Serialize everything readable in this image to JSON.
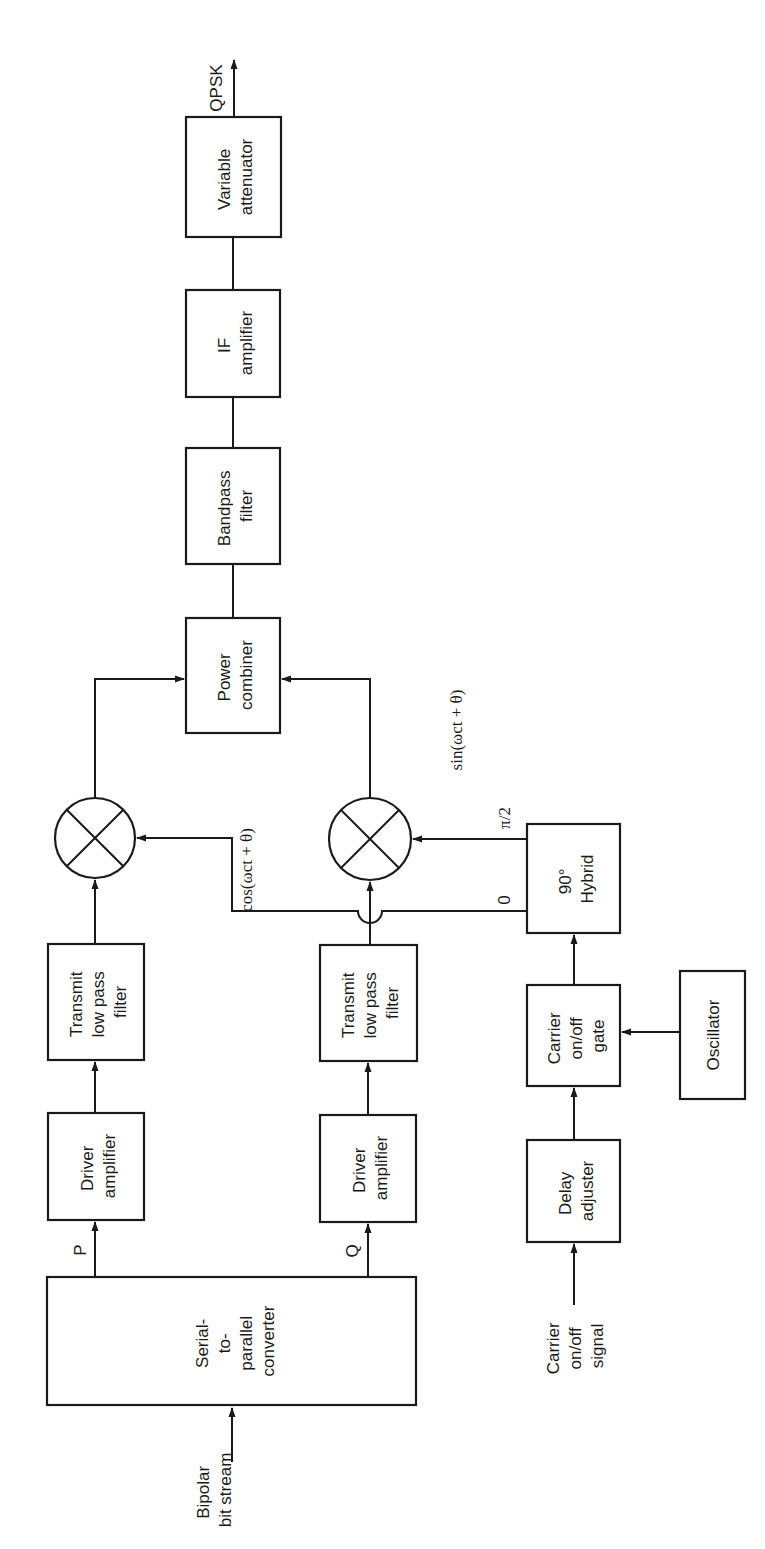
{
  "figure": {
    "orientation": "rotated-90-ccw",
    "line_color": "#1a1a1a",
    "background": "#ffffff"
  },
  "blocks": {
    "serial_to_parallel": {
      "lines": [
        "Serial-",
        "to-",
        "parallel",
        "converter"
      ]
    },
    "driver_amp_p": {
      "lines": [
        "Driver",
        "amplifier"
      ]
    },
    "driver_amp_q": {
      "lines": [
        "Driver",
        "amplifier"
      ]
    },
    "lpf_p": {
      "lines": [
        "Transmit",
        "low pass",
        "filter"
      ]
    },
    "lpf_q": {
      "lines": [
        "Transmit",
        "low pass",
        "filter"
      ]
    },
    "mixer_p": {
      "symbol": "multiplier-icon"
    },
    "mixer_q": {
      "symbol": "multiplier-icon"
    },
    "power_combiner": {
      "lines": [
        "Power",
        "combiner"
      ]
    },
    "bandpass_filter": {
      "lines": [
        "Bandpass",
        "filter"
      ]
    },
    "if_amplifier": {
      "lines": [
        "IF",
        "amplifier"
      ]
    },
    "variable_attenuator": {
      "lines": [
        "Variable",
        "attenuator"
      ]
    },
    "hybrid_90": {
      "lines": [
        "90°",
        "Hybrid"
      ]
    },
    "carrier_gate": {
      "lines": [
        "Carrier",
        "on/off",
        "gate"
      ]
    },
    "oscillator": {
      "lines": [
        "Oscillator"
      ]
    },
    "delay_adjuster": {
      "lines": [
        "Delay",
        "adjuster"
      ]
    }
  },
  "labels": {
    "input_bitstream": [
      "Bipolar",
      "bit stream"
    ],
    "carrier_signal": [
      "Carrier",
      "on/off",
      "signal"
    ],
    "p_branch": "P",
    "q_branch": "Q",
    "output": "QPSK",
    "cos_carrier": "cos(ωct + θ)",
    "sin_carrier": "sin(ωct + θ)",
    "hybrid_port_0": "0",
    "hybrid_port_90": "π/2"
  }
}
